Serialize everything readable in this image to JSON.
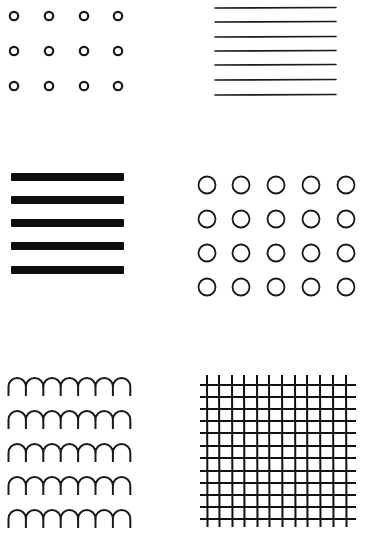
{
  "figure": {
    "stroke_color": "#1a1a1a",
    "background": "#ffffff",
    "panels": [
      {
        "id": "small-circles",
        "pattern": "small hollow circles",
        "rows": 3,
        "cols": 4,
        "cx": [
          14,
          49,
          84,
          118
        ],
        "cy": [
          16,
          51,
          86
        ],
        "r": 4.2,
        "stroke_width": 2.2
      },
      {
        "id": "thin-lines",
        "pattern": "thin horizontal lines",
        "count": 7,
        "x1": 215,
        "x2": 336,
        "y": [
          8,
          22,
          37,
          51,
          65,
          80,
          95
        ],
        "stroke_width": 1.6
      },
      {
        "id": "thick-bars",
        "pattern": "thick horizontal bars",
        "count": 5,
        "x": 11,
        "width": 113,
        "height": 8,
        "y": [
          177,
          200,
          223,
          246,
          270
        ]
      },
      {
        "id": "large-circles",
        "pattern": "large hollow circles",
        "rows": 4,
        "cols": 5,
        "cx": [
          207,
          241,
          276,
          311,
          346
        ],
        "cy": [
          185,
          219,
          253,
          287
        ],
        "r": 8.5,
        "stroke_width": 1.8
      },
      {
        "id": "scallops",
        "pattern": "scalloped arches",
        "rows": 5,
        "arches_per_row": 7,
        "x_start": 8.5,
        "arch_width": 17.4,
        "row_top": [
          378,
          411,
          444,
          477,
          510
        ],
        "leg_height": 18,
        "stroke_width": 2
      },
      {
        "id": "grid",
        "pattern": "cross-hatch grid",
        "vertical_x": [
          207,
          219,
          232,
          244,
          257,
          269,
          282,
          295,
          307,
          320,
          333,
          346
        ],
        "vertical_y1": 375,
        "vertical_y2": 527,
        "horizontal_y": [
          385,
          397,
          409,
          421,
          433,
          446,
          458,
          471,
          483,
          495,
          507,
          519
        ],
        "horizontal_x1": 200,
        "horizontal_x2": 356,
        "stroke_width": 2
      }
    ]
  }
}
